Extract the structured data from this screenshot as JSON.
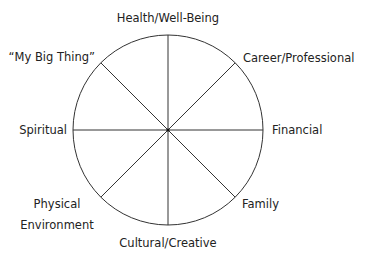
{
  "diagram": {
    "type": "wheel-of-life",
    "segments": 8,
    "line_color": "#333333",
    "text_color": "#222222",
    "labels": {
      "top": "Health/Well-Being",
      "top_right": "Career/Professional",
      "right": "Financial",
      "bottom_right": "Family",
      "bottom": "Cultural/Creative",
      "bottom_left_line1": "Physical",
      "bottom_left_line2": "Environment",
      "left": "Spiritual",
      "top_left": "“My Big Thing”"
    }
  }
}
